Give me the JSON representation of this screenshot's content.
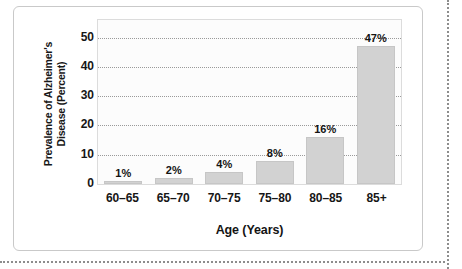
{
  "chart_data": {
    "type": "bar",
    "title": "",
    "subtitle": "",
    "xlabel": "Age (Years)",
    "ylabel": "Prevalence of Alzheimer's Disease (Percent)",
    "ylabel_line1": "Prevalence of Alzheimer's",
    "ylabel_line2": "Disease (Percent)",
    "categories": [
      "60–65",
      "65–70",
      "70–75",
      "75–80",
      "80–85",
      "85+"
    ],
    "values": [
      1,
      2,
      4,
      8,
      16,
      47
    ],
    "value_labels": [
      "1%",
      "2%",
      "4%",
      "8%",
      "16%",
      "47%"
    ],
    "ylim": [
      0,
      56
    ],
    "yticks": [
      0,
      10,
      20,
      30,
      40,
      50
    ],
    "ytick_labels": [
      "0",
      "10",
      "20",
      "30",
      "40",
      "50"
    ],
    "gridlines": [
      10,
      20,
      30,
      40,
      50
    ],
    "grid": true,
    "grid_style": "dotted",
    "legend": null,
    "legend_position": "none",
    "colors": {
      "bar_fill": "#d2d2d2",
      "bar_edge": "#c6c6c6",
      "gridline": "#9a9a9a",
      "plot_background": "#fcfcfc",
      "plot_border": "#dcdcdc",
      "text": "#141414",
      "card_border": "#c9c9c9",
      "page_rule": "#8d8d8d"
    }
  }
}
